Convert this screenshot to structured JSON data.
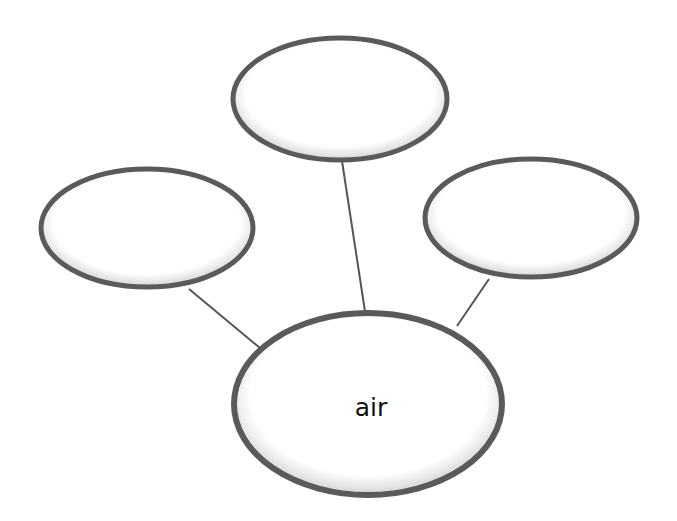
{
  "diagram": {
    "type": "concept-web",
    "center": {
      "label": "air",
      "cx": 368,
      "cy": 404,
      "rx": 134,
      "ry": 92
    },
    "satellites": [
      {
        "id": "top",
        "label": "",
        "cx": 340,
        "cy": 99,
        "rx": 107,
        "ry": 61
      },
      {
        "id": "left",
        "label": "",
        "cx": 147,
        "cy": 228,
        "rx": 106,
        "ry": 59
      },
      {
        "id": "right",
        "label": "",
        "cx": 531,
        "cy": 218,
        "rx": 106,
        "ry": 59
      }
    ],
    "connectors": [
      {
        "from": "left",
        "to": "center",
        "x1": 189,
        "y1": 289,
        "x2": 266,
        "y2": 353
      },
      {
        "from": "top",
        "to": "center",
        "x1": 342,
        "y1": 161,
        "x2": 366,
        "y2": 318
      },
      {
        "from": "right",
        "to": "center",
        "x1": 489,
        "y1": 279,
        "x2": 457,
        "y2": 326
      }
    ],
    "colors": {
      "outline": "#5a5a5a",
      "connector": "#555555",
      "fill": "#ffffff",
      "shadow": "#c8c8c8"
    }
  }
}
